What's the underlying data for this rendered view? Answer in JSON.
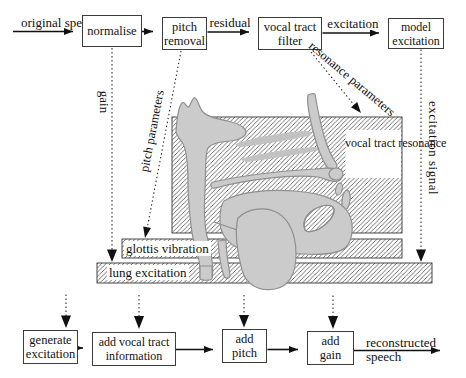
{
  "diagram": {
    "top_flow": {
      "input_line1": "original",
      "input_line2": "speech",
      "normalise": "normalise",
      "pitch_removal_line1": "pitch",
      "pitch_removal_line2": "removal",
      "residual": "residual",
      "vocal_tract_filter_line1": "vocal tract",
      "vocal_tract_filter_line2": "filter",
      "excitation": "excitation",
      "model_excitation_line1": "model",
      "model_excitation_line2": "excitation"
    },
    "analysis_labels": {
      "gain": "gain",
      "pitch_parameters": "pitch parameters",
      "resonance_line1": "resonance",
      "resonance_line2": "parameters",
      "excitation_signal": "excitation signal"
    },
    "anatomy": {
      "vocal_tract_resonance_line1": "vocal",
      "vocal_tract_resonance_line2": "tract",
      "vocal_tract_resonance_line3": "resonance",
      "glottis_vibration": "glottis vibration",
      "lung_excitation": "lung excitation"
    },
    "bottom_flow": {
      "generate_excitation_line1": "generate",
      "generate_excitation_line2": "excitation",
      "add_vocal_tract_line1": "add vocal tract",
      "add_vocal_tract_line2": "information",
      "add_pitch_line1": "add",
      "add_pitch_line2": "pitch",
      "add_gain_line1": "add",
      "add_gain_line2": "gain",
      "output_line1": "reconstructed",
      "output_line2": "speech"
    },
    "colors": {
      "ink": "#111111",
      "figure_fill": "#cbcbcb",
      "figure_outline": "#8f8f8f",
      "hatch": "#333333"
    }
  }
}
